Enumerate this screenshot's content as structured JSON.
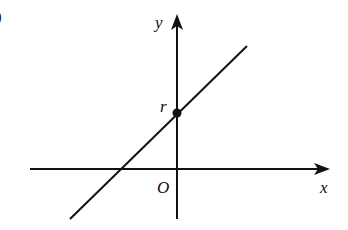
{
  "figure": {
    "corner_mark": ")",
    "axes": {
      "x_label": "x",
      "y_label": "y",
      "origin_label": "O"
    },
    "line": {
      "description": "straight line with positive slope crossing negative x-axis and positive y-axis",
      "y_intercept_label": "r"
    },
    "colors": {
      "stroke": "#111111",
      "background": "#ffffff"
    }
  }
}
